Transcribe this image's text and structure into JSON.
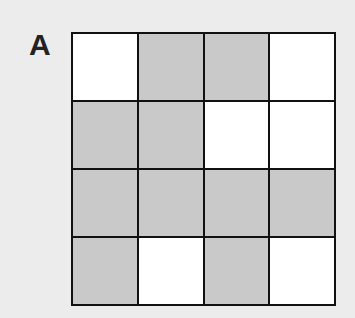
{
  "panel_label": "A",
  "grid": {
    "rows": 4,
    "cols": 4,
    "cells": [
      [
        "white",
        "gray",
        "gray",
        "white"
      ],
      [
        "gray",
        "gray",
        "white",
        "white"
      ],
      [
        "gray",
        "gray",
        "gray",
        "gray"
      ],
      [
        "gray",
        "white",
        "gray",
        "white"
      ]
    ]
  },
  "colors": {
    "gray": "#c9c9c9",
    "white": "#ffffff",
    "border": "#111111",
    "background": "#ececec"
  }
}
